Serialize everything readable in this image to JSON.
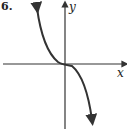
{
  "figure": {
    "problem_number": "6.",
    "x_axis_label": "x",
    "y_axis_label": "y",
    "curve": "decreasing cubic (y = -x^3 shape), inflection at origin, arrows at both ends",
    "line_color": "#333333"
  }
}
